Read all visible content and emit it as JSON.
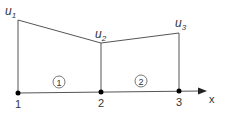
{
  "diagram": {
    "type": "piecewise-linear-1d-elements",
    "axis_label": "x",
    "colors": {
      "line": "#555555",
      "node": "#000000",
      "text": "#333333"
    },
    "nodes": [
      {
        "id": "1",
        "label": "1",
        "value_label": "u",
        "value_sub": "1"
      },
      {
        "id": "2",
        "label": "2",
        "value_label": "u",
        "value_sub": "2"
      },
      {
        "id": "3",
        "label": "3",
        "value_label": "u",
        "value_sub": "3"
      }
    ],
    "elements": [
      {
        "id": "1",
        "label": "1",
        "from": "1",
        "to": "2"
      },
      {
        "id": "2",
        "label": "2",
        "from": "2",
        "to": "3"
      }
    ]
  }
}
